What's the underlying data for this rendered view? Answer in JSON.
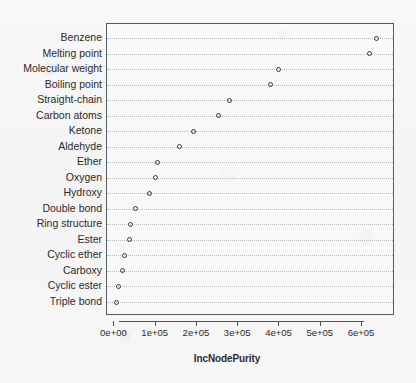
{
  "chart_data": {
    "type": "scatter",
    "title": "",
    "subtitle": "",
    "xlabel": "IncNodePurity",
    "ylabel": "",
    "xlim": [
      -18000,
      680000
    ],
    "xticks": [
      0,
      100000,
      200000,
      300000,
      400000,
      500000,
      600000
    ],
    "xticklabels": [
      "0e+00",
      "1e+05",
      "2e+05",
      "3e+05",
      "4e+05",
      "5e+05",
      "6e+05"
    ],
    "grid": "horizontal-dotted",
    "legend": "none",
    "marker": "open-circle",
    "categories": [
      "Benzene",
      "Melting point",
      "Molecular weight",
      "Boiling point",
      "Straight-chain",
      "Carbon atoms",
      "Ketone",
      "Aldehyde",
      "Ether",
      "Oxygen",
      "Hydroxy",
      "Double bond",
      "Ring structure",
      "Ester",
      "Cyclic ether",
      "Carboxy",
      "Cyclic ester",
      "Triple bond"
    ],
    "values": [
      635000,
      618000,
      398000,
      378000,
      279000,
      252000,
      192000,
      158000,
      105000,
      100000,
      84000,
      52000,
      40000,
      37000,
      25000,
      19000,
      11000,
      5000
    ],
    "points": [
      {
        "label": "Benzene",
        "value": 635000
      },
      {
        "label": "Melting point",
        "value": 618000
      },
      {
        "label": "Molecular weight",
        "value": 398000
      },
      {
        "label": "Boiling point",
        "value": 378000
      },
      {
        "label": "Straight-chain",
        "value": 279000
      },
      {
        "label": "Carbon atoms",
        "value": 252000
      },
      {
        "label": "Ketone",
        "value": 192000
      },
      {
        "label": "Aldehyde",
        "value": 158000
      },
      {
        "label": "Ether",
        "value": 105000
      },
      {
        "label": "Oxygen",
        "value": 100000
      },
      {
        "label": "Hydroxy",
        "value": 84000
      },
      {
        "label": "Double bond",
        "value": 52000
      },
      {
        "label": "Ring structure",
        "value": 40000
      },
      {
        "label": "Ester",
        "value": 37000
      },
      {
        "label": "Cyclic ether",
        "value": 25000
      },
      {
        "label": "Carboxy",
        "value": 19000
      },
      {
        "label": "Cyclic ester",
        "value": 11000
      },
      {
        "label": "Triple bond",
        "value": 5000
      }
    ],
    "colors": {
      "marker_stroke": "#3a3a3a",
      "panel_border": "#555c5f",
      "gridline": "#b9b9b9",
      "text": "#2a2a2a",
      "background": "#f7f7f7"
    }
  }
}
